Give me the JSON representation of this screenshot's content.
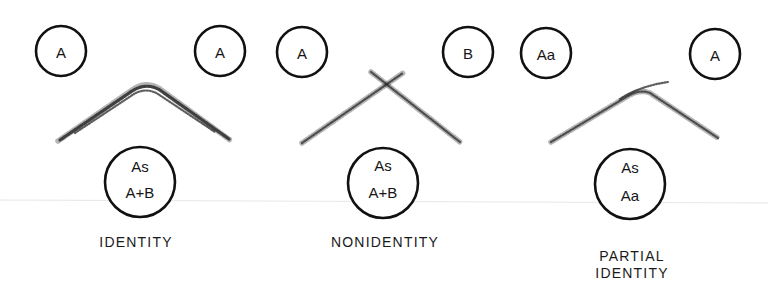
{
  "figure": {
    "panels": [
      {
        "caption_lines": [
          "IDENTITY"
        ],
        "top_left_well": "A",
        "top_right_well": "A",
        "bottom_well_lines": [
          "As",
          "A+B"
        ],
        "precipitin_pattern": "fused arc"
      },
      {
        "caption_lines": [
          "NONIDENTITY"
        ],
        "top_left_well": "A",
        "top_right_well": "B",
        "bottom_well_lines": [
          "As",
          "A+B"
        ],
        "precipitin_pattern": "crossing lines"
      },
      {
        "caption_lines": [
          "PARTIAL",
          "IDENTITY"
        ],
        "top_left_well": "Aa",
        "top_right_well": "A",
        "bottom_well_lines": [
          "As",
          "Aa"
        ],
        "precipitin_pattern": "arc with spur"
      }
    ]
  },
  "colors": {
    "ink": "#111111",
    "background": "#ffffff"
  }
}
